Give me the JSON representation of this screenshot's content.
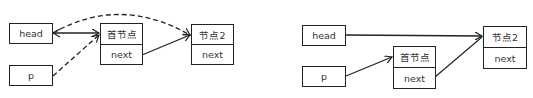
{
  "left_diagram": {
    "head": {
      "label": "head"
    },
    "p": {
      "label": "p"
    },
    "first_node": {
      "title": "首节点",
      "field": "next"
    },
    "node2": {
      "title": "节点2",
      "field": "next"
    },
    "edges": [
      {
        "from": "head",
        "to": "首节点",
        "style": "solid"
      },
      {
        "from": "首节点.next",
        "to": "节点2",
        "style": "solid"
      },
      {
        "from": "p",
        "to": "首节点",
        "style": "dashed"
      },
      {
        "from": "head",
        "to": "节点2",
        "style": "dashed-curve"
      }
    ]
  },
  "right_diagram": {
    "head": {
      "label": "head"
    },
    "p": {
      "label": "p"
    },
    "first_node": {
      "title": "首节点",
      "field": "next"
    },
    "node2": {
      "title": "节点2",
      "field": "next"
    },
    "edges": [
      {
        "from": "head",
        "to": "节点2",
        "style": "solid"
      },
      {
        "from": "p",
        "to": "首节点",
        "style": "solid"
      },
      {
        "from": "首节点.next",
        "to": "节点2",
        "style": "solid"
      }
    ]
  }
}
